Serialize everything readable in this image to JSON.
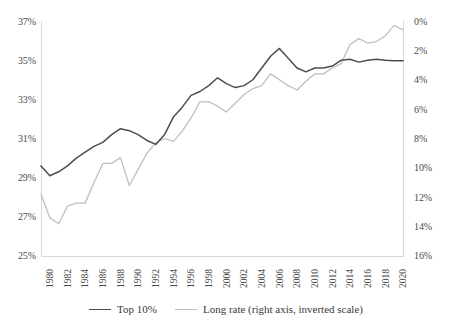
{
  "chart_data": {
    "type": "line",
    "title": "",
    "subtitle": "",
    "xlabel": "",
    "ylabel": "",
    "grid": false,
    "legend_position": "bottom",
    "x": [
      1980,
      1981,
      1982,
      1983,
      1984,
      1985,
      1986,
      1987,
      1988,
      1989,
      1990,
      1991,
      1992,
      1993,
      1994,
      1995,
      1996,
      1997,
      1998,
      1999,
      2000,
      2001,
      2002,
      2003,
      2004,
      2005,
      2006,
      2007,
      2008,
      2009,
      2010,
      2011,
      2012,
      2013,
      2014,
      2015,
      2016,
      2017,
      2018,
      2019,
      2020,
      2021
    ],
    "x_tick_labels": [
      "1980",
      "1982",
      "1984",
      "1986",
      "1988",
      "1990",
      "1992",
      "1994",
      "1996",
      "1998",
      "2000",
      "2002",
      "2004",
      "2006",
      "2008",
      "2010",
      "2012",
      "2014",
      "2016",
      "2018",
      "2020"
    ],
    "xlim": [
      1980,
      2021
    ],
    "axes": {
      "left": {
        "label": "",
        "ylim": [
          25,
          37
        ],
        "tick_labels": [
          "37%",
          "35%",
          "33%",
          "31%",
          "29%",
          "27%",
          "25%"
        ],
        "tick_values": [
          37,
          35,
          33,
          31,
          29,
          27,
          25
        ],
        "inverted": false
      },
      "right": {
        "label": "",
        "ylim": [
          0,
          16
        ],
        "tick_labels": [
          "0%",
          "2%",
          "4%",
          "6%",
          "8%",
          "10%",
          "12%",
          "14%",
          "16%"
        ],
        "tick_values": [
          0,
          2,
          4,
          6,
          8,
          10,
          12,
          14,
          16
        ],
        "inverted": true
      }
    },
    "series": [
      {
        "name": "Top 10%",
        "axis": "left",
        "color": "#4d4d4d",
        "legend_label": "Top 10%",
        "values": [
          29.6,
          29.1,
          29.3,
          29.6,
          30.0,
          30.3,
          30.6,
          30.8,
          31.2,
          31.5,
          31.4,
          31.2,
          30.9,
          30.7,
          31.2,
          32.1,
          32.6,
          33.2,
          33.4,
          33.7,
          34.1,
          33.8,
          33.6,
          33.7,
          34.0,
          34.6,
          35.2,
          35.6,
          35.1,
          34.6,
          34.4,
          34.6,
          34.6,
          34.7,
          35.0,
          35.05,
          34.9,
          35.0,
          35.05,
          35.0,
          34.97,
          34.97
        ]
      },
      {
        "name": "Long rate (right axis, inverted scale)",
        "axis": "right",
        "color": "#bfbfbf",
        "legend_label": "Long rate (right axis, inverted scale)",
        "values": [
          11.8,
          13.4,
          13.8,
          12.6,
          12.4,
          12.4,
          11.0,
          9.7,
          9.7,
          9.3,
          11.2,
          10.1,
          9.0,
          8.3,
          8.0,
          8.2,
          7.5,
          6.6,
          5.5,
          5.5,
          5.8,
          6.2,
          5.6,
          5.0,
          4.6,
          4.4,
          3.6,
          4.0,
          4.4,
          4.7,
          4.1,
          3.6,
          3.6,
          3.2,
          2.9,
          1.6,
          1.2,
          1.5,
          1.4,
          1.0,
          0.3,
          0.6
        ]
      }
    ]
  }
}
